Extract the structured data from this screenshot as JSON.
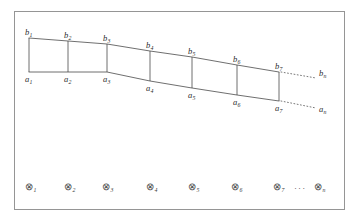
{
  "figure": {
    "frame": {
      "name": "figure-border",
      "x": 14.5,
      "y": 11.5,
      "width": 330,
      "height": 198,
      "stroke": "#8a8a8a",
      "stroke_width": 0.9
    },
    "stroke_color": "#4a4a4a",
    "stroke_width": 0.8,
    "dotted_color": "#6a6a6a",
    "band": {
      "description": "strip bounded above by polyline through b-points and below by polyline through a-points",
      "top_points": [
        {
          "label": "b",
          "sub": "1",
          "x": 29,
          "y": 38
        },
        {
          "label": "b",
          "sub": "2",
          "x": 68,
          "y": 41
        },
        {
          "label": "b",
          "sub": "3",
          "x": 107,
          "y": 44
        },
        {
          "label": "b",
          "sub": "4",
          "x": 150,
          "y": 51
        },
        {
          "label": "b",
          "sub": "5",
          "x": 192,
          "y": 57
        },
        {
          "label": "b",
          "sub": "6",
          "x": 237,
          "y": 65
        },
        {
          "label": "b",
          "sub": "7",
          "x": 279,
          "y": 72
        }
      ],
      "bottom_points": [
        {
          "label": "a",
          "sub": "1",
          "x": 29,
          "y": 72
        },
        {
          "label": "a",
          "sub": "2",
          "x": 68,
          "y": 72
        },
        {
          "label": "a",
          "sub": "3",
          "x": 107,
          "y": 72
        },
        {
          "label": "a",
          "sub": "4",
          "x": 150,
          "y": 81
        },
        {
          "label": "a",
          "sub": "5",
          "x": 192,
          "y": 88
        },
        {
          "label": "a",
          "sub": "6",
          "x": 237,
          "y": 95
        },
        {
          "label": "a",
          "sub": "7",
          "x": 279,
          "y": 101
        }
      ],
      "dotted_top": {
        "x1": 281,
        "y1": 72,
        "x2": 316,
        "y2": 78
      },
      "dotted_bottom": {
        "x1": 281,
        "y1": 101,
        "x2": 316,
        "y2": 108
      },
      "terminal_top": {
        "label": "b",
        "sub": "n",
        "x": 319,
        "y": 69
      },
      "terminal_bottom": {
        "label": "a",
        "sub": "n",
        "x": 319,
        "y": 105
      }
    },
    "top_labels": [
      {
        "label": "b",
        "sub": "1",
        "x": 25,
        "y": 28
      },
      {
        "label": "b",
        "sub": "2",
        "x": 64,
        "y": 31
      },
      {
        "label": "b",
        "sub": "3",
        "x": 103,
        "y": 34
      },
      {
        "label": "b",
        "sub": "4",
        "x": 146,
        "y": 41
      },
      {
        "label": "b",
        "sub": "5",
        "x": 188,
        "y": 47
      },
      {
        "label": "b",
        "sub": "6",
        "x": 233,
        "y": 55
      },
      {
        "label": "b",
        "sub": "7",
        "x": 275,
        "y": 62
      }
    ],
    "bottom_labels": [
      {
        "label": "a",
        "sub": "1",
        "x": 25,
        "y": 75
      },
      {
        "label": "a",
        "sub": "2",
        "x": 64,
        "y": 75
      },
      {
        "label": "a",
        "sub": "3",
        "x": 103,
        "y": 75
      },
      {
        "label": "a",
        "sub": "4",
        "x": 146,
        "y": 84
      },
      {
        "label": "a",
        "sub": "5",
        "x": 188,
        "y": 91
      },
      {
        "label": "a",
        "sub": "6",
        "x": 233,
        "y": 98
      },
      {
        "label": "a",
        "sub": "7",
        "x": 275,
        "y": 104
      }
    ],
    "nodes": {
      "glyph": "⊗",
      "glyph_name": "circled-times-icon",
      "y": 183,
      "items": [
        {
          "sub": "1",
          "x": 25
        },
        {
          "sub": "2",
          "x": 64
        },
        {
          "sub": "3",
          "x": 102
        },
        {
          "sub": "4",
          "x": 146
        },
        {
          "sub": "5",
          "x": 188
        },
        {
          "sub": "6",
          "x": 231
        },
        {
          "sub": "7",
          "x": 273
        },
        {
          "sub": "n",
          "x": 314
        }
      ],
      "ellipsis": {
        "text": "···",
        "x": 294,
        "y": 184
      }
    }
  }
}
